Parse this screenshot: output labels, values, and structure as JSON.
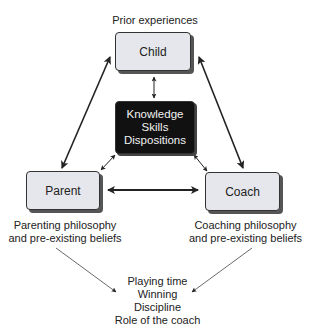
{
  "diagram": {
    "top_annotation": "Prior experiences",
    "nodes": {
      "child": "Child",
      "center": [
        "Knowledge",
        "Skills",
        "Dispositions"
      ],
      "parent": "Parent",
      "coach": "Coach"
    },
    "parent_annotation": [
      "Parenting philosophy",
      "and pre-existing beliefs"
    ],
    "coach_annotation": [
      "Coaching philosophy",
      "and pre-existing beliefs"
    ],
    "outcomes": [
      "Playing time",
      "Winning",
      "Discipline",
      "Role of the coach"
    ],
    "colors": {
      "light_box": "#e6e7ec",
      "dark_box": "#111111",
      "arrow": "#222222"
    }
  }
}
